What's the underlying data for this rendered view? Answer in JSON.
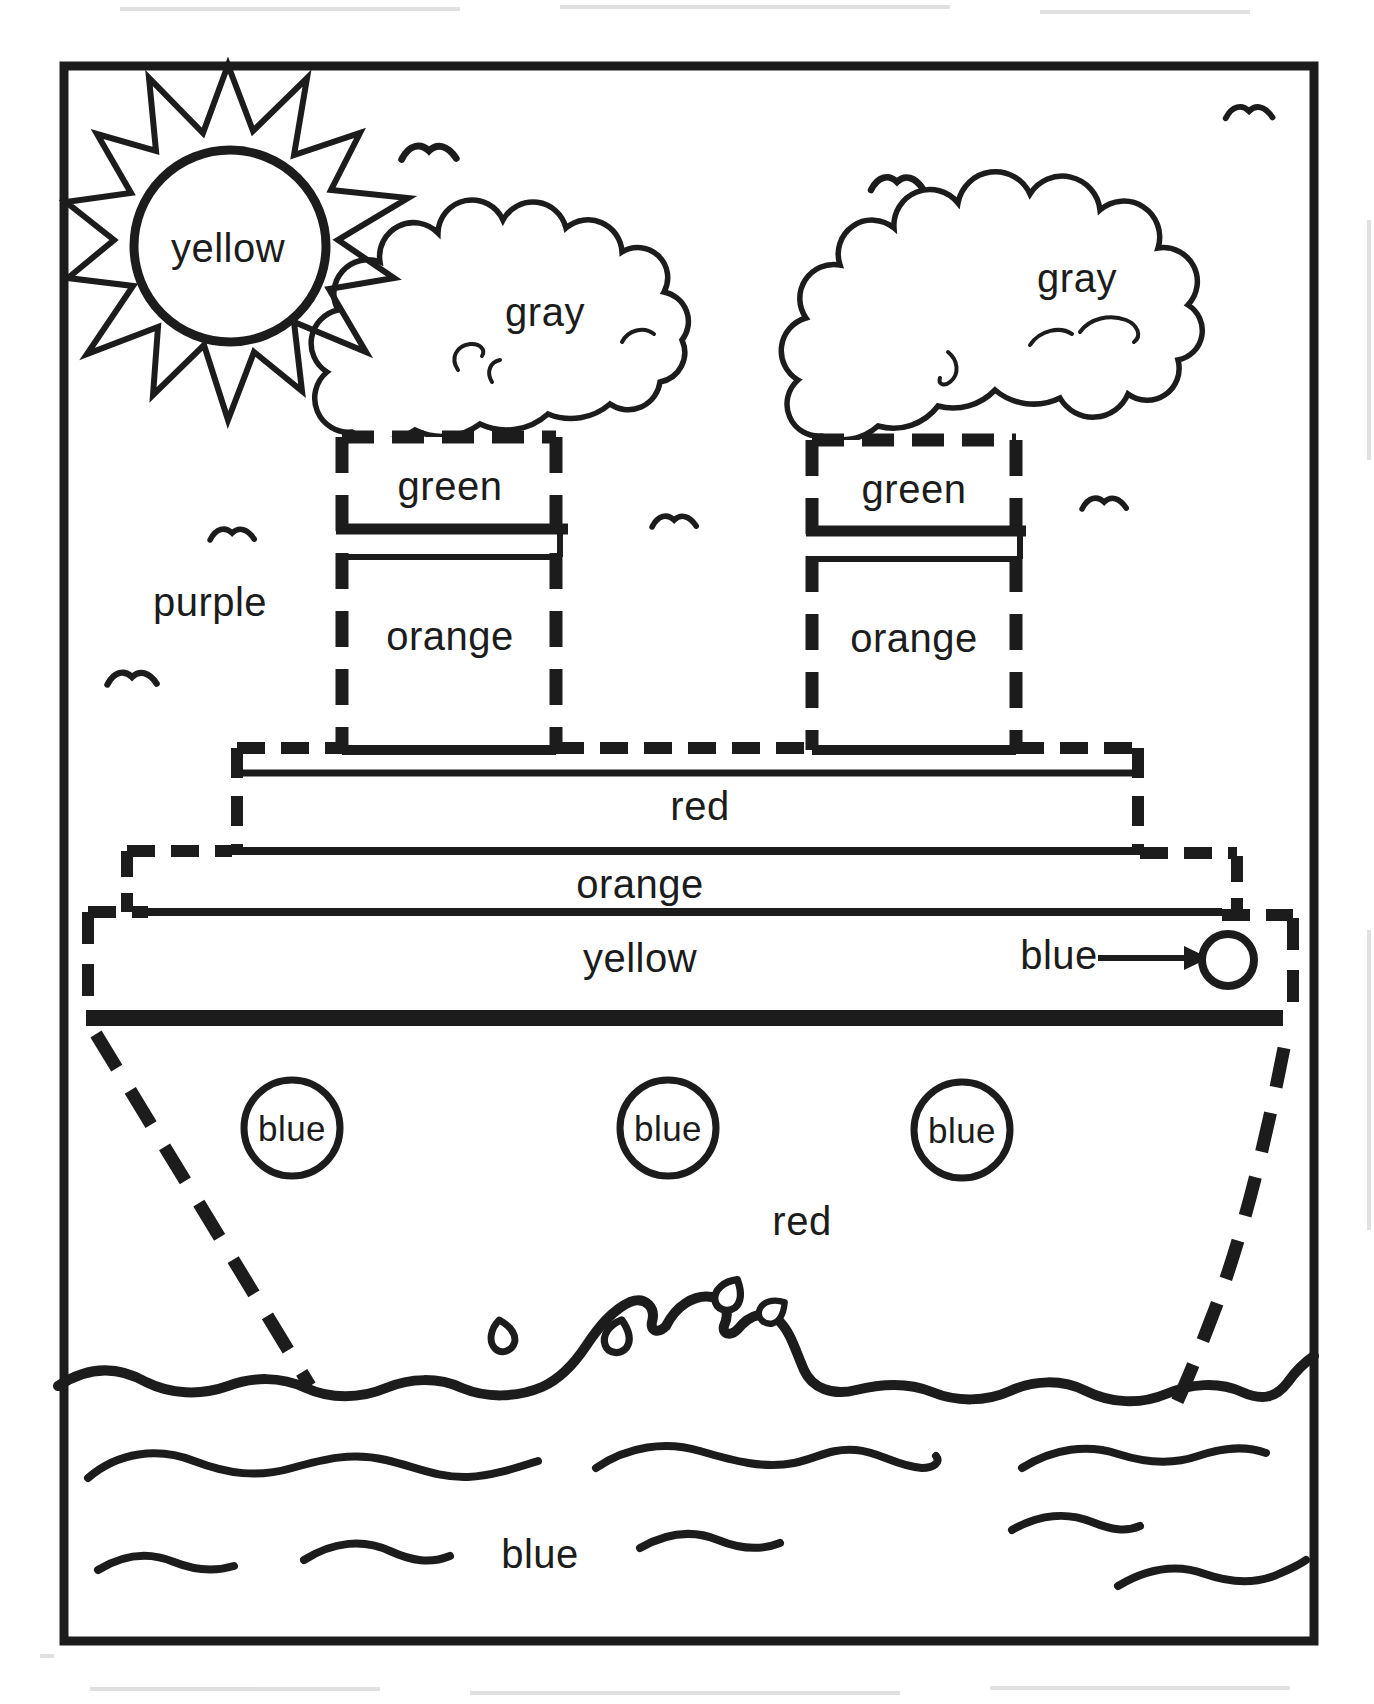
{
  "worksheet": {
    "kind": "color-by-word coloring page",
    "subject": "steamship at sea"
  },
  "color_words": {
    "sun": "yellow",
    "smoke_left": "gray",
    "smoke_right": "gray",
    "funnel_left_band": "green",
    "funnel_left_body": "orange",
    "funnel_right_band": "green",
    "funnel_right_body": "orange",
    "sky": "purple",
    "upper_deck": "red",
    "middle_deck": "orange",
    "lower_deck": "yellow",
    "deck_porthole": "blue",
    "hull_porthole_1": "blue",
    "hull_porthole_2": "blue",
    "hull_porthole_3": "blue",
    "hull": "red",
    "water": "blue"
  },
  "palette": {
    "ink": "#1c1c1c",
    "paper": "#ffffff"
  }
}
